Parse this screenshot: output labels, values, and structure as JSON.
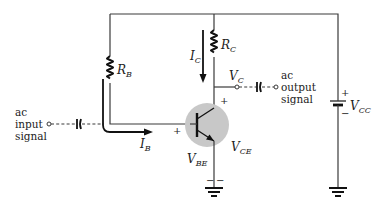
{
  "diagram": {
    "type": "circuit-schematic",
    "colors": {
      "wire": "#3a3a3a",
      "transistor_highlight": "#c8c8c8",
      "text": "#222222"
    },
    "components": {
      "rb": {
        "label": "R",
        "sub": "B"
      },
      "rc": {
        "label": "R",
        "sub": "C"
      },
      "vcc": {
        "label": "V",
        "sub": "CC",
        "plus": "+",
        "minus": "−"
      },
      "transistor": {
        "type": "NPN"
      }
    },
    "currents": {
      "ic": {
        "label": "I",
        "sub": "C"
      },
      "ib": {
        "label": "I",
        "sub": "B"
      }
    },
    "voltages": {
      "vc": {
        "label": "V",
        "sub": "C",
        "plus": "+"
      },
      "vbe": {
        "label": "V",
        "sub": "BE",
        "plus": "+",
        "minus": "−"
      },
      "vce": {
        "label": "V",
        "sub": "CE"
      }
    },
    "input": {
      "line1": "ac",
      "line2": "input",
      "line3": "signal"
    },
    "output": {
      "line1": "ac",
      "line2": "output",
      "line3": "signal"
    }
  }
}
